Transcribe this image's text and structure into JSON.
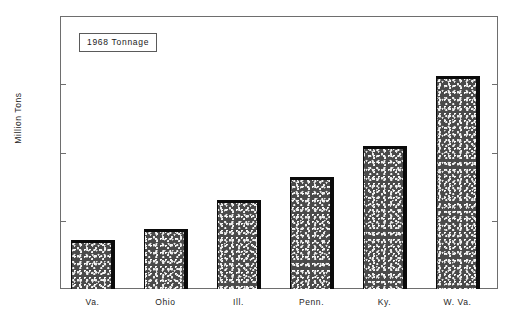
{
  "chart_data": {
    "type": "bar",
    "title": "1968 Tonnage",
    "xlabel": "",
    "ylabel": "Million Tons",
    "categories": [
      "Va.",
      "Ohio",
      "Ill.",
      "Penn.",
      "Ky.",
      "W. Va."
    ],
    "values": [
      36,
      44,
      65,
      82,
      105,
      156
    ],
    "ylim": [
      0,
      200
    ],
    "yticks": [
      0,
      50,
      100,
      150,
      200
    ],
    "ytick_labels": [
      "0",
      "50",
      "100",
      "150",
      "200"
    ],
    "grid": false,
    "legend": null,
    "annotations": [
      "1968 Tonnage"
    ],
    "bar_fill": "stipple-texture",
    "bar_edge_color": "#0b0b0b",
    "axis_color": "#6e6e6e",
    "background_color": "#ffffff"
  },
  "axes": {
    "y_title": "Million Tons",
    "ticks": [
      {
        "label": "200",
        "value": 200
      },
      {
        "label": "150",
        "value": 150
      },
      {
        "label": "100",
        "value": 100
      },
      {
        "label": "50",
        "value": 50
      },
      {
        "label": "0",
        "value": 0
      }
    ]
  },
  "bars": [
    {
      "label": "Va.",
      "value": 36
    },
    {
      "label": "Ohio",
      "value": 44
    },
    {
      "label": "Ill.",
      "value": 65
    },
    {
      "label": "Penn.",
      "value": 82
    },
    {
      "label": "Ky.",
      "value": 105
    },
    {
      "label": "W. Va.",
      "value": 156
    }
  ]
}
